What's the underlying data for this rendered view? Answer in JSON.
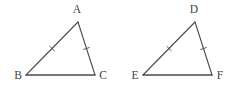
{
  "figure": {
    "kind": "geometry-diagram",
    "background_color": "#ffffff",
    "stroke_color": "#4a4a50",
    "label_color": "#3f3f45",
    "canvas": {
      "width": 234,
      "height": 88
    },
    "triangles": [
      {
        "id": "triangle-abc",
        "name": "triangle-abc",
        "vertices": [
          {
            "label": "A",
            "name": "vertex-a",
            "x": 78,
            "y": 22,
            "label_x": 77,
            "label_y": 13,
            "label_anchor": "middle"
          },
          {
            "label": "B",
            "name": "vertex-b",
            "x": 26,
            "y": 75,
            "label_x": 18,
            "label_y": 79,
            "label_anchor": "middle"
          },
          {
            "label": "C",
            "name": "vertex-c",
            "x": 95,
            "y": 75,
            "label_x": 103,
            "label_y": 79,
            "label_anchor": "middle"
          }
        ],
        "sides": [
          {
            "name": "side-ab",
            "from": "A",
            "to": "B",
            "ticks": 1,
            "stroke_width": 1.1
          },
          {
            "name": "side-ac",
            "from": "A",
            "to": "C",
            "ticks": 1,
            "stroke_width": 1.1
          },
          {
            "name": "side-bc",
            "from": "B",
            "to": "C",
            "ticks": 0,
            "stroke_width": 1.5
          }
        ]
      },
      {
        "id": "triangle-def",
        "name": "triangle-def",
        "vertices": [
          {
            "label": "D",
            "name": "vertex-d",
            "x": 195,
            "y": 22,
            "label_x": 194,
            "label_y": 13,
            "label_anchor": "middle"
          },
          {
            "label": "E",
            "name": "vertex-e",
            "x": 143,
            "y": 75,
            "label_x": 135,
            "label_y": 79,
            "label_anchor": "middle"
          },
          {
            "label": "F",
            "name": "vertex-f",
            "x": 212,
            "y": 75,
            "label_x": 220,
            "label_y": 79,
            "label_anchor": "middle"
          }
        ],
        "sides": [
          {
            "name": "side-de",
            "from": "D",
            "to": "E",
            "ticks": 1,
            "stroke_width": 1.1
          },
          {
            "name": "side-df",
            "from": "D",
            "to": "F",
            "ticks": 1,
            "stroke_width": 1.1
          },
          {
            "name": "side-ef",
            "from": "E",
            "to": "F",
            "ticks": 0,
            "stroke_width": 1.5
          }
        ]
      }
    ],
    "tick_mark": {
      "length": 6,
      "stroke_width": 0.9
    }
  }
}
